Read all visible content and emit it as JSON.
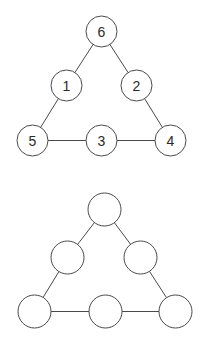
{
  "figure": {
    "background_color": "#ffffff",
    "stroke_color": "#4a4a4a",
    "node_fill_color": "#ffffff",
    "label_color": "#2b2b2b",
    "stroke_width": 1,
    "label_font_size": 14
  },
  "diagrams": [
    {
      "id": "labeled-triangle-graph",
      "name": "Labeled triangle graph",
      "labelled": true,
      "node_radius": 15.5,
      "nodes": [
        {
          "id": "n6",
          "label": "6",
          "role": "apex",
          "x": 101.5,
          "y": 31.5
        },
        {
          "id": "n1",
          "label": "1",
          "role": "left-mid",
          "x": 66.5,
          "y": 85.5
        },
        {
          "id": "n2",
          "label": "2",
          "role": "right-mid",
          "x": 136.5,
          "y": 85.5
        },
        {
          "id": "n5",
          "label": "5",
          "role": "bottom-left",
          "x": 32.5,
          "y": 140.5
        },
        {
          "id": "n3",
          "label": "3",
          "role": "bottom-mid",
          "x": 101.5,
          "y": 140.5
        },
        {
          "id": "n4",
          "label": "4",
          "role": "bottom-right",
          "x": 170.5,
          "y": 140.5
        }
      ],
      "edges": [
        {
          "from": "n6",
          "to": "n1"
        },
        {
          "from": "n6",
          "to": "n2"
        },
        {
          "from": "n1",
          "to": "n5"
        },
        {
          "from": "n2",
          "to": "n4"
        },
        {
          "from": "n5",
          "to": "n3"
        },
        {
          "from": "n3",
          "to": "n4"
        }
      ]
    },
    {
      "id": "blank-triangle-graph",
      "name": "Blank triangle graph",
      "labelled": false,
      "node_radius": 16.5,
      "nodes": [
        {
          "id": "b1",
          "label": "",
          "role": "apex",
          "x": 104.5,
          "y": 209.5
        },
        {
          "id": "b2",
          "label": "",
          "role": "left-mid",
          "x": 67.5,
          "y": 257.5
        },
        {
          "id": "b3",
          "label": "",
          "role": "right-mid",
          "x": 140.5,
          "y": 257.5
        },
        {
          "id": "b4",
          "label": "",
          "role": "bottom-left",
          "x": 34.5,
          "y": 311.5
        },
        {
          "id": "b5",
          "label": "",
          "role": "bottom-mid",
          "x": 105.5,
          "y": 311.5
        },
        {
          "id": "b6",
          "label": "",
          "role": "bottom-right",
          "x": 175.5,
          "y": 311.5
        }
      ],
      "edges": [
        {
          "from": "b1",
          "to": "b2"
        },
        {
          "from": "b1",
          "to": "b3"
        },
        {
          "from": "b2",
          "to": "b4"
        },
        {
          "from": "b3",
          "to": "b6"
        },
        {
          "from": "b4",
          "to": "b5"
        },
        {
          "from": "b5",
          "to": "b6"
        }
      ]
    }
  ]
}
